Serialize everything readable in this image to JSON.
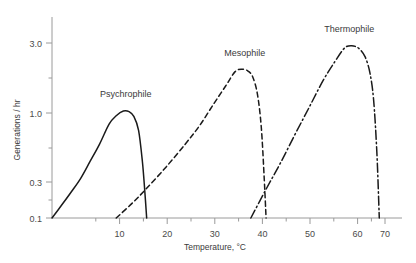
{
  "chart_data": {
    "type": "line",
    "title": "",
    "xlabel": "Temperature, °C",
    "ylabel": "Generations / hr",
    "xlim": [
      0,
      73
    ],
    "ylim": [
      0.1,
      4.2
    ],
    "yscale": "log",
    "grid": false,
    "legend_position": "inline-annotations",
    "xticks": [
      10,
      20,
      30,
      40,
      50,
      60,
      70
    ],
    "xtick_labels": [
      "10",
      "20",
      "30",
      "40",
      "50",
      "60",
      "70"
    ],
    "xticks_minor": [
      5,
      15,
      25,
      35,
      45,
      55,
      65
    ],
    "yticks": [
      0.1,
      0.3,
      1.0,
      3.0
    ],
    "ytick_labels": [
      "0.1",
      "0.3",
      "1.0",
      "3.0"
    ],
    "yticks_minor": [
      0.2,
      0.5,
      2.0
    ],
    "series": [
      {
        "name": "Psychrophile",
        "linestyle": "solid",
        "color": "#1a1a1a",
        "peak_temperature": 15,
        "peak_value": 0.8,
        "x": [
          0,
          2,
          4,
          6,
          8,
          10,
          12,
          13.5,
          15,
          16.2,
          17.2,
          18.2,
          19.0,
          19.5,
          19.9
        ],
        "y": [
          0.1,
          0.128,
          0.165,
          0.215,
          0.3,
          0.42,
          0.62,
          0.73,
          0.8,
          0.79,
          0.72,
          0.55,
          0.3,
          0.17,
          0.1
        ]
      },
      {
        "name": "Mesophile",
        "linestyle": "dashed",
        "color": "#1a1a1a",
        "peak_temperature": 39,
        "peak_value": 1.8,
        "x": [
          13.5,
          17,
          20,
          24,
          28,
          31,
          34,
          36.5,
          38.5,
          40,
          41.2,
          42.2,
          43.2,
          44.0,
          44.6,
          45.0
        ],
        "y": [
          0.1,
          0.135,
          0.18,
          0.27,
          0.42,
          0.6,
          0.92,
          1.3,
          1.72,
          1.8,
          1.74,
          1.55,
          1.1,
          0.58,
          0.22,
          0.1
        ]
      },
      {
        "name": "Thermophile",
        "linestyle": "dashdot",
        "color": "#1a1a1a",
        "peak_temperature": 62,
        "peak_value": 2.85,
        "x": [
          41.8,
          45,
          48,
          51,
          54,
          57,
          59.5,
          61.5,
          63,
          64.5,
          65.8,
          66.8,
          67.6,
          68.3,
          68.8
        ],
        "y": [
          0.1,
          0.175,
          0.29,
          0.5,
          0.85,
          1.45,
          2.1,
          2.72,
          2.85,
          2.7,
          2.3,
          1.7,
          1.0,
          0.35,
          0.1
        ]
      }
    ],
    "annotations": [
      {
        "text": "Psychrophile",
        "x": 15.5,
        "y": 1.05
      },
      {
        "text": "Mesophile",
        "x": 40.5,
        "y": 2.35
      },
      {
        "text": "Thermophile",
        "x": 62.5,
        "y": 3.75
      }
    ]
  }
}
